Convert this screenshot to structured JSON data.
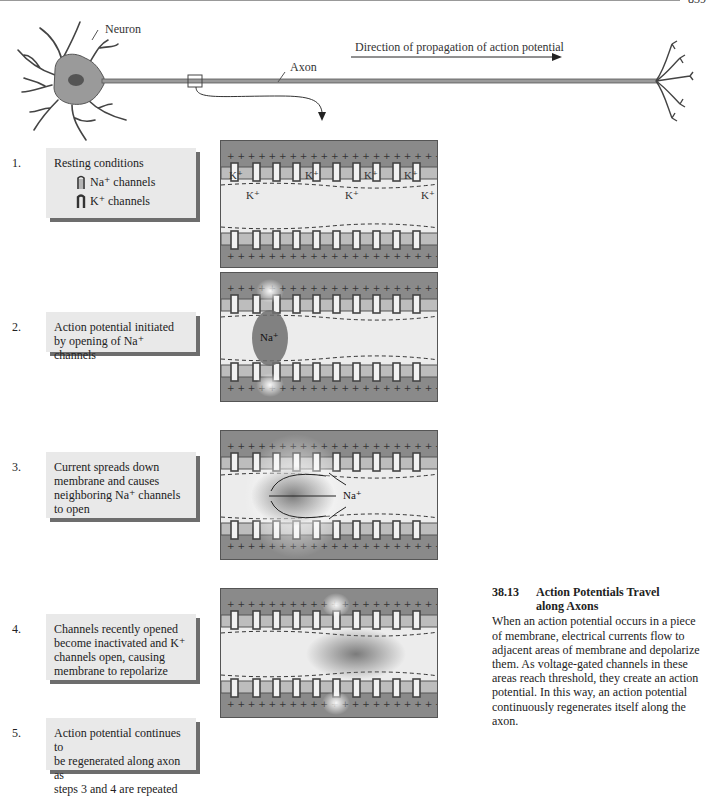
{
  "page": {
    "page_number": "839"
  },
  "neuron_diagram": {
    "neuron_label": "Neuron",
    "axon_label": "Axon",
    "direction_label": "Direction of propagation of action potential"
  },
  "legend": {
    "na_channel_label": "Na⁺ channels",
    "k_channel_label": "K⁺ channels"
  },
  "steps": [
    {
      "number": "1.",
      "text": "Resting conditions"
    },
    {
      "number": "2.",
      "lines": [
        "Action potential initiated",
        "by opening of Na⁺ channels"
      ]
    },
    {
      "number": "3.",
      "lines": [
        "Current spreads down",
        "membrane and causes",
        "neighboring Na⁺ channels",
        "to open"
      ]
    },
    {
      "number": "4.",
      "lines": [
        "Channels recently opened",
        "become inactivated and K⁺",
        "channels open, causing",
        "membrane to repolarize"
      ]
    },
    {
      "number": "5.",
      "lines": [
        "Action potential continues to",
        "be regenerated along axon as",
        "steps 3 and 4 are repeated"
      ]
    }
  ],
  "panels": {
    "panel1": {
      "ion_labels": [
        "K⁺",
        "K⁺",
        "K⁺",
        "K⁺",
        "K⁺",
        "K⁺",
        "K⁺"
      ]
    },
    "panel2": {
      "ion_label": "Na⁺"
    },
    "panel3": {
      "ion_label": "Na⁺"
    }
  },
  "caption": {
    "figure_number": "38.13",
    "title_line1": "Action Potentials Travel",
    "title_line2": "along Axons",
    "body": "When an action potential occurs in a piece of membrane, electrical currents flow to adjacent areas of membrane and depolarize them. As voltage-gated channels in these areas reach threshold, they create an action potential. In this way, an action potential continuously regenerates itself along the axon."
  },
  "colors": {
    "extracellular": "#8a8a8a",
    "cytoplasm": "#ececec",
    "membrane": "#bdbdbd",
    "channel": "#5a5a5a",
    "neuron_body": "#9a9a9a",
    "callout_box": "#e9e9e9",
    "callout_shadow": "#6d6d6d"
  }
}
